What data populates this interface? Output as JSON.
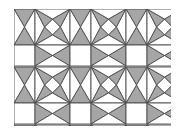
{
  "figure": {
    "width": 181,
    "height": 134,
    "colors": {
      "fill_gray": "#a6a6a6",
      "fill_white": "#ffffff",
      "stroke": "#4a4a4a",
      "background": "#ffffff"
    },
    "tile": {
      "origin_x": 14,
      "origin_y": 9,
      "period_x": 56,
      "period_y": 58,
      "side": 21,
      "gap": 35,
      "cols": 3,
      "rows": 2
    },
    "clip": {
      "x": 14,
      "y": 9,
      "width": 157,
      "height": 117
    }
  }
}
